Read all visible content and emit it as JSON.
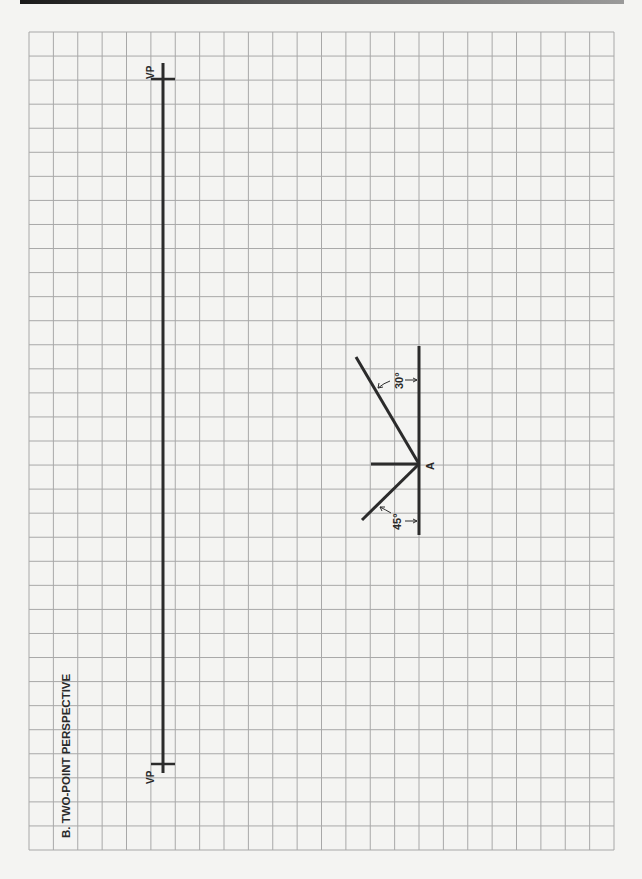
{
  "figure": {
    "section_label": "B. TWO-POINT PERSPECTIVE",
    "grid": {
      "left": 29,
      "top": 32,
      "cols": 24,
      "rows": 34,
      "cell": 24.06,
      "line_color": "#a8a8a8"
    },
    "horizon_line": {
      "x": 163,
      "y_top": 63,
      "y_bottom": 773,
      "vanishing_points": [
        {
          "label": "VP",
          "y": 79
        },
        {
          "label": "VP",
          "y": 764
        }
      ]
    },
    "object": {
      "point_label": "A",
      "point": {
        "x": 419,
        "y": 464
      },
      "picture_plane": {
        "y_top": 346,
        "y_bottom": 535
      },
      "angles": [
        {
          "label": "30°",
          "direction": "upper-left"
        },
        {
          "label": "45°",
          "direction": "lower-left"
        }
      ]
    },
    "stroke_color": "#2b2b2b"
  }
}
